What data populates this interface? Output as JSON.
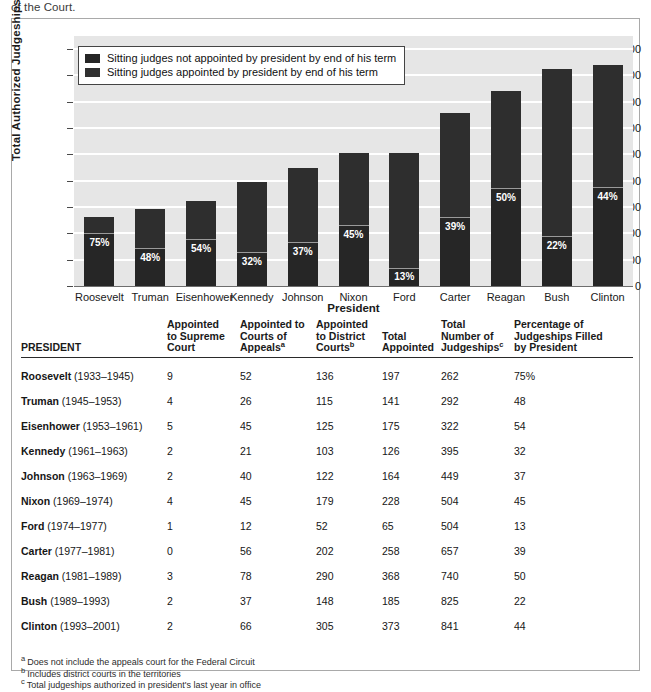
{
  "page": {
    "running_text": "of the Court."
  },
  "chart_data": {
    "type": "bar",
    "title": "",
    "xlabel": "President",
    "ylabel": "Total Authorized Judgeships",
    "ylim": [
      0,
      950
    ],
    "yticks": [
      0,
      100,
      200,
      300,
      400,
      500,
      600,
      700,
      800,
      900
    ],
    "grid": true,
    "legend_position": "top-left",
    "stacked": true,
    "categories": [
      "Roosevelt",
      "Truman",
      "Eisenhower",
      "Kennedy",
      "Johnson",
      "Nixon",
      "Ford",
      "Carter",
      "Reagan",
      "Bush",
      "Clinton"
    ],
    "values": [
      262,
      292,
      322,
      395,
      449,
      504,
      504,
      657,
      740,
      825,
      841
    ],
    "series": [
      {
        "name": "Sitting judges appointed by president by end of his term",
        "color": "#262626",
        "values": [
          197,
          141,
          175,
          126,
          164,
          228,
          65,
          258,
          368,
          185,
          373
        ]
      },
      {
        "name": "Sitting judges not appointed by president by end of his term",
        "color": "#303030",
        "values": [
          65,
          151,
          147,
          269,
          285,
          276,
          439,
          399,
          372,
          640,
          468
        ]
      }
    ],
    "data_labels": [
      "75%",
      "48%",
      "54%",
      "32%",
      "37%",
      "45%",
      "13%",
      "39%",
      "50%",
      "22%",
      "44%"
    ],
    "legend": [
      "Sitting judges not appointed by president by end of his term",
      "Sitting judges appointed by president by end of his term"
    ]
  },
  "table": {
    "headers": [
      "PRESIDENT",
      "Appointed to Supreme Court",
      "Appointed to Courts of Appeals",
      "Appointed to District Courts",
      "Total Appointed",
      "Total Number of Judgeships",
      "Percentage of Judgeships Filled by President"
    ],
    "header_lines": [
      [
        "PRESIDENT"
      ],
      [
        "Appointed",
        "to Supreme",
        "Court"
      ],
      [
        "Appointed to",
        "Courts of",
        "Appeals"
      ],
      [
        "Appointed",
        "to District",
        "Courts"
      ],
      [
        "Total",
        "Appointed"
      ],
      [
        "Total",
        "Number of",
        "Judgeships"
      ],
      [
        "Percentage of",
        "Judgeships Filled",
        "by President"
      ]
    ],
    "header_footnote_markers": [
      "",
      "",
      "a",
      "b",
      "",
      "c",
      ""
    ],
    "rows": [
      {
        "president": "Roosevelt",
        "years": "(1933–1945)",
        "supreme": "9",
        "appeals": "52",
        "district": "136",
        "total_appointed": "197",
        "total_judgeships": "262",
        "percentage": "75%"
      },
      {
        "president": "Truman",
        "years": "(1945–1953)",
        "supreme": "4",
        "appeals": "26",
        "district": "115",
        "total_appointed": "141",
        "total_judgeships": "292",
        "percentage": "48"
      },
      {
        "president": "Eisenhower",
        "years": "(1953–1961)",
        "supreme": "5",
        "appeals": "45",
        "district": "125",
        "total_appointed": "175",
        "total_judgeships": "322",
        "percentage": "54"
      },
      {
        "president": "Kennedy",
        "years": "(1961–1963)",
        "supreme": "2",
        "appeals": "21",
        "district": "103",
        "total_appointed": "126",
        "total_judgeships": "395",
        "percentage": "32"
      },
      {
        "president": "Johnson",
        "years": "(1963–1969)",
        "supreme": "2",
        "appeals": "40",
        "district": "122",
        "total_appointed": "164",
        "total_judgeships": "449",
        "percentage": "37"
      },
      {
        "president": "Nixon",
        "years": "(1969–1974)",
        "supreme": "4",
        "appeals": "45",
        "district": "179",
        "total_appointed": "228",
        "total_judgeships": "504",
        "percentage": "45"
      },
      {
        "president": "Ford",
        "years": "(1974–1977)",
        "supreme": "1",
        "appeals": "12",
        "district": "52",
        "total_appointed": "65",
        "total_judgeships": "504",
        "percentage": "13"
      },
      {
        "president": "Carter",
        "years": "(1977–1981)",
        "supreme": "0",
        "appeals": "56",
        "district": "202",
        "total_appointed": "258",
        "total_judgeships": "657",
        "percentage": "39"
      },
      {
        "president": "Reagan",
        "years": "(1981–1989)",
        "supreme": "3",
        "appeals": "78",
        "district": "290",
        "total_appointed": "368",
        "total_judgeships": "740",
        "percentage": "50"
      },
      {
        "president": "Bush",
        "years": "(1989–1993)",
        "supreme": "2",
        "appeals": "37",
        "district": "148",
        "total_appointed": "185",
        "total_judgeships": "825",
        "percentage": "22"
      },
      {
        "president": "Clinton",
        "years": "(1993–2001)",
        "supreme": "2",
        "appeals": "66",
        "district": "305",
        "total_appointed": "373",
        "total_judgeships": "841",
        "percentage": "44"
      }
    ]
  },
  "footnotes": [
    {
      "marker": "a",
      "text": "Does not include the appeals court for the Federal Circuit"
    },
    {
      "marker": "b",
      "text": "Includes district courts in the territories"
    },
    {
      "marker": "c",
      "text": "Total judgeships authorized in president's last year in office"
    }
  ]
}
